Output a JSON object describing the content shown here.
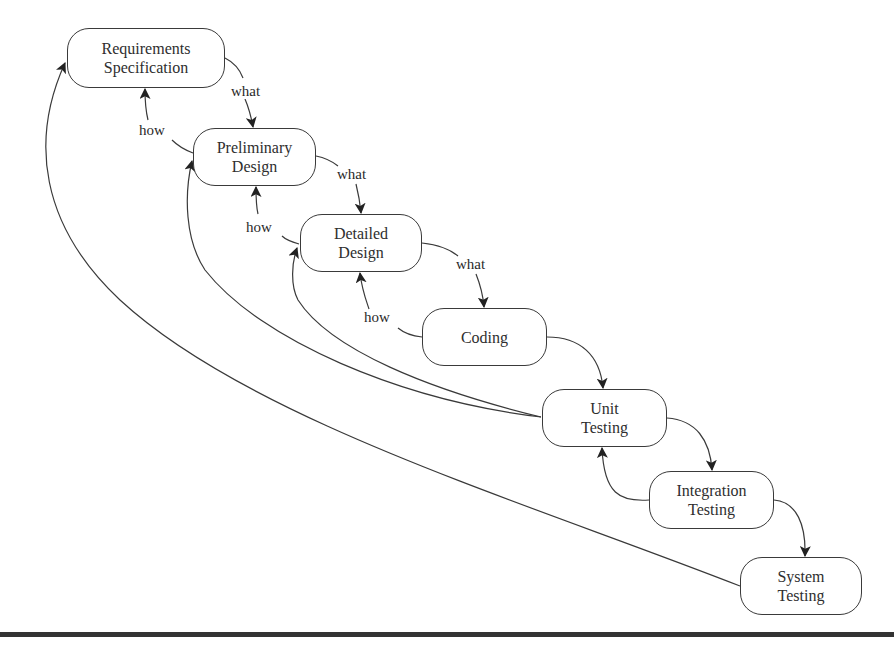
{
  "diagram": {
    "title": "",
    "colors": {
      "stroke": "#3a3a3a",
      "text": "#2e2e2e",
      "background": "#ffffff",
      "rule": "#333333"
    },
    "nodes": [
      {
        "id": "requirements",
        "label": "Requirements\nSpecification",
        "x": 67,
        "y": 28,
        "w": 158,
        "h": 60
      },
      {
        "id": "preliminary",
        "label": "Preliminary\nDesign",
        "x": 193,
        "y": 128,
        "w": 123,
        "h": 58
      },
      {
        "id": "detailed",
        "label": "Detailed\nDesign",
        "x": 300,
        "y": 214,
        "w": 122,
        "h": 58
      },
      {
        "id": "coding",
        "label": "Coding",
        "x": 422,
        "y": 308,
        "w": 125,
        "h": 58
      },
      {
        "id": "unit",
        "label": "Unit\nTesting",
        "x": 542,
        "y": 389,
        "w": 125,
        "h": 58
      },
      {
        "id": "integration",
        "label": "Integration\nTesting",
        "x": 649,
        "y": 471,
        "w": 125,
        "h": 58
      },
      {
        "id": "system",
        "label": "System\nTesting",
        "x": 740,
        "y": 557,
        "w": 122,
        "h": 58
      }
    ],
    "edge_labels": [
      {
        "id": "what-1",
        "text": "what",
        "x": 230,
        "y": 84
      },
      {
        "id": "how-1",
        "text": "how",
        "x": 138,
        "y": 123
      },
      {
        "id": "what-2",
        "text": "what",
        "x": 336,
        "y": 167
      },
      {
        "id": "how-2",
        "text": "how",
        "x": 245,
        "y": 220
      },
      {
        "id": "what-3",
        "text": "what",
        "x": 455,
        "y": 257
      },
      {
        "id": "how-3",
        "text": "how",
        "x": 363,
        "y": 310
      }
    ],
    "edges": [
      {
        "from": "requirements",
        "to": "preliminary",
        "label": "what"
      },
      {
        "from": "preliminary",
        "to": "requirements",
        "label": "how"
      },
      {
        "from": "preliminary",
        "to": "detailed",
        "label": "what"
      },
      {
        "from": "detailed",
        "to": "preliminary",
        "label": "how"
      },
      {
        "from": "detailed",
        "to": "coding",
        "label": "what"
      },
      {
        "from": "coding",
        "to": "detailed",
        "label": "how"
      },
      {
        "from": "coding",
        "to": "unit",
        "label": ""
      },
      {
        "from": "unit",
        "to": "integration",
        "label": ""
      },
      {
        "from": "integration",
        "to": "unit",
        "label": ""
      },
      {
        "from": "integration",
        "to": "system",
        "label": ""
      },
      {
        "from": "unit",
        "to": "preliminary",
        "label": ""
      },
      {
        "from": "unit",
        "to": "detailed",
        "label": ""
      },
      {
        "from": "system",
        "to": "requirements",
        "label": ""
      }
    ]
  }
}
